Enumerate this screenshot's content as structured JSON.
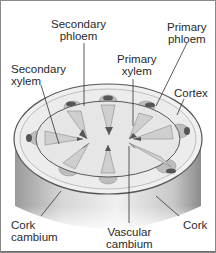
{
  "diagram": {
    "colors": {
      "bark_dark": "#7a7a7a",
      "bark_light": "#d9d9d9",
      "top_surface": "#eeeeee",
      "cortex_ring": "#e2e2e2",
      "bundle_fill": "#bdbdbd",
      "bundle_dark": "#555555",
      "line": "#333333"
    },
    "labels": {
      "secondary_phloem": {
        "line1": "Secondary",
        "line2": "phloem"
      },
      "primary_phloem": {
        "line1": "Primary",
        "line2": "phloem"
      },
      "secondary_xylem": {
        "line1": "Secondary",
        "line2": "xylem"
      },
      "primary_xylem": {
        "line1": "Primary",
        "line2": "xylem"
      },
      "cortex": {
        "line1": "Cortex"
      },
      "cork_cambium": {
        "line1": "Cork",
        "line2": "cambium"
      },
      "vascular_cambium": {
        "line1": "Vascular",
        "line2": "cambium"
      },
      "cork": {
        "line1": "Cork"
      }
    }
  }
}
